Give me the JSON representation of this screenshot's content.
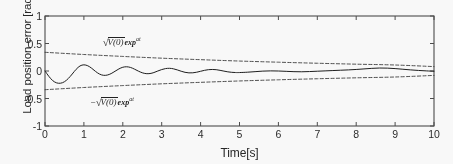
{
  "chart_data": {
    "type": "line",
    "title": "",
    "xlabel": "Time[s]",
    "ylabel": "Load position error [rad]",
    "xlim": [
      0,
      10
    ],
    "ylim": [
      -1,
      1
    ],
    "xticks": [
      "0",
      "1",
      "2",
      "3",
      "4",
      "5",
      "6",
      "7",
      "8",
      "9",
      "10"
    ],
    "yticks": [
      "1",
      "0.5",
      "0",
      "-0.5",
      "-1"
    ],
    "grid": false,
    "legend_position": "none",
    "annotations": [
      {
        "id": "upper-envelope-label",
        "radical_sign": "√",
        "radicand": "V(0)",
        "expression": "exp",
        "superscript": "at",
        "full_text": "√V(0)exp^{at}",
        "sign_prefix": "",
        "x": 1.7,
        "y": 0.52
      },
      {
        "id": "lower-envelope-label",
        "radical_sign": "√",
        "radicand": "V(0)",
        "expression": "exp",
        "superscript": "at",
        "full_text": "-√V(0)exp^{at}",
        "sign_prefix": "−",
        "x": 1.25,
        "y": -0.5
      }
    ],
    "series": [
      {
        "name": "Load position error",
        "style": "solid",
        "color": "#1a1a1a",
        "x": [
          0.0,
          0.1,
          0.2,
          0.3,
          0.4,
          0.5,
          0.6,
          0.7,
          0.8,
          0.9,
          1.0,
          1.1,
          1.2,
          1.3,
          1.4,
          1.5,
          1.6,
          1.7,
          1.8,
          1.9,
          2.0,
          2.1,
          2.2,
          2.3,
          2.4,
          2.5,
          2.6,
          2.7,
          2.8,
          2.9,
          3.0,
          3.1,
          3.2,
          3.3,
          3.4,
          3.5,
          3.6,
          3.7,
          3.8,
          3.9,
          4.0,
          4.1,
          4.2,
          4.3,
          4.4,
          4.5,
          4.6,
          4.7,
          4.8,
          4.9,
          5.0,
          5.2,
          5.4,
          5.6,
          5.8,
          6.0,
          6.2,
          6.4,
          6.6,
          6.8,
          7.0,
          7.2,
          7.4,
          7.6,
          7.8,
          8.0,
          8.2,
          8.4,
          8.6,
          8.8,
          9.0,
          9.2,
          9.4,
          9.6,
          9.8,
          10.0
        ],
        "y": [
          0.0,
          -0.098,
          -0.176,
          -0.216,
          -0.222,
          -0.195,
          -0.136,
          -0.055,
          0.03,
          0.092,
          0.112,
          0.095,
          0.05,
          -0.008,
          -0.055,
          -0.078,
          -0.074,
          -0.047,
          -0.005,
          0.038,
          0.068,
          0.077,
          0.064,
          0.034,
          -0.002,
          -0.032,
          -0.048,
          -0.046,
          -0.028,
          0.0,
          0.026,
          0.044,
          0.049,
          0.04,
          0.02,
          -0.004,
          -0.024,
          -0.034,
          -0.033,
          -0.022,
          -0.005,
          0.012,
          0.024,
          0.028,
          0.024,
          0.012,
          -0.002,
          -0.015,
          -0.024,
          -0.028,
          -0.028,
          -0.022,
          -0.012,
          -0.002,
          0.002,
          0.0,
          -0.006,
          -0.012,
          -0.014,
          -0.01,
          -0.004,
          0.002,
          0.008,
          0.014,
          0.02,
          0.028,
          0.038,
          0.048,
          0.054,
          0.052,
          0.044,
          0.032,
          0.02,
          0.01,
          0.002,
          -0.004
        ]
      },
      {
        "name": "Upper bound √V(0)exp(at)",
        "style": "dashed",
        "color": "#3a3a3a",
        "x": [
          0,
          1,
          2,
          3,
          4,
          5,
          6,
          7,
          8,
          9,
          10
        ],
        "y": [
          0.34,
          0.3,
          0.265,
          0.233,
          0.206,
          0.181,
          0.16,
          0.141,
          0.124,
          0.109,
          0.08
        ]
      },
      {
        "name": "Lower bound -√V(0)exp(at)",
        "style": "dashed",
        "color": "#3a3a3a",
        "x": [
          0,
          1,
          2,
          3,
          4,
          5,
          6,
          7,
          8,
          9,
          10
        ],
        "y": [
          -0.34,
          -0.3,
          -0.265,
          -0.233,
          -0.206,
          -0.181,
          -0.16,
          -0.141,
          -0.124,
          -0.109,
          -0.08
        ]
      }
    ]
  }
}
